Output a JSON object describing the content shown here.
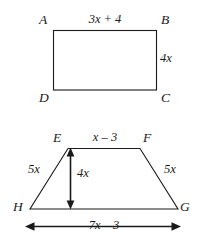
{
  "figure": {
    "background_color": "#ffffff",
    "stroke_color": "#1a1a1a",
    "text_color": "#1a1a1a"
  },
  "rectangle": {
    "name": "rectangle-abcd",
    "vertices": {
      "A": "A",
      "B": "B",
      "C": "C",
      "D": "D"
    },
    "sides": {
      "top_label": "3x + 4",
      "right_label": "4x"
    }
  },
  "trapezoid": {
    "name": "trapezoid-efgh",
    "vertices": {
      "E": "E",
      "F": "F",
      "G": "G",
      "H": "H"
    },
    "sides": {
      "top_label": "x – 3",
      "left_leg_label": "5x",
      "right_leg_label": "5x",
      "height_label": "4x",
      "base_label": "7x – 3"
    }
  }
}
